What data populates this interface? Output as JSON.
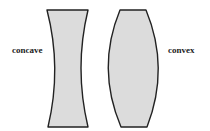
{
  "diagram": {
    "labels": {
      "concave": "concave",
      "convex": "convex"
    },
    "colors": {
      "lens_fill": "#dcdcdc",
      "lens_stroke": "#222222",
      "text": "#222222",
      "background": "#ffffff"
    },
    "shapes": [
      {
        "name": "concave-lens",
        "type": "concave"
      },
      {
        "name": "convex-lens",
        "type": "convex"
      }
    ]
  }
}
